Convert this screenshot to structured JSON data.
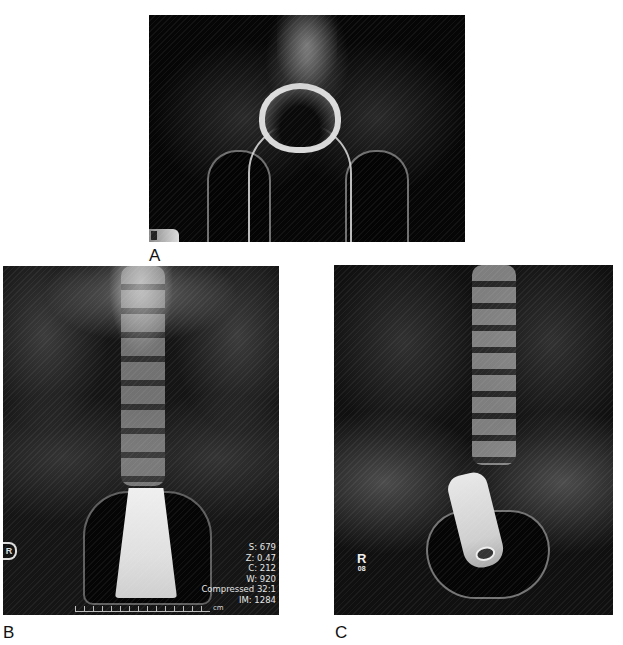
{
  "figure": {
    "panels": [
      {
        "id": "A",
        "label": "A",
        "description": "Pelvic X-ray (AP) showing ring-shaped foreign object with looped cord in pelvis"
      },
      {
        "id": "B",
        "label": "B",
        "description": "Abdominal-pelvic X-ray (AP) showing large radiopaque conical foreign object in rectum",
        "side_marker": "R",
        "overlay": {
          "s": "S: 679",
          "z": "Z: 0.47",
          "c": "C: 212",
          "w": "W: 920",
          "compression": "Compressed 32:1",
          "im": "IM: 1284"
        },
        "ruler_unit": "cm"
      },
      {
        "id": "C",
        "label": "C",
        "description": "Abdominal-pelvic X-ray (AP) showing cylindrical radiopaque foreign object in rectosigmoid",
        "side_marker": "R",
        "side_marker_sub": "08"
      }
    ]
  }
}
